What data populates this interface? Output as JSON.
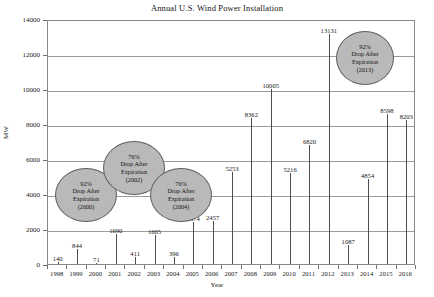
{
  "chart_data": {
    "type": "bar",
    "title": "Annual U.S. Wind Power Installation",
    "xlabel": "Year",
    "ylabel": "MW",
    "categories": [
      "1998",
      "1999",
      "2000",
      "2001",
      "2002",
      "2003",
      "2004",
      "2005",
      "2006",
      "2007",
      "2008",
      "2009",
      "2010",
      "2011",
      "2012",
      "2013",
      "2014",
      "2015",
      "2016"
    ],
    "values": [
      140,
      844,
      71,
      1690,
      411,
      1665,
      396,
      2374,
      2457,
      5253,
      8362,
      10005,
      5216,
      6820,
      13131,
      1087,
      4854,
      8598,
      8203
    ],
    "ylim": [
      0,
      14000
    ],
    "y_ticks": [
      "0",
      "2000",
      "4000",
      "6000",
      "8000",
      "10000",
      "12000",
      "14000"
    ],
    "grid": true,
    "legend": "none",
    "annotations": [
      {
        "id": "expiration-2000",
        "percent": "92%",
        "line1": "Drop After",
        "line2": "Expiration",
        "year": "(2000)"
      },
      {
        "id": "expiration-2002",
        "percent": "76%",
        "line1": "Drop After",
        "line2": "Expiration",
        "year": "(2002)"
      },
      {
        "id": "expiration-2004",
        "percent": "76%",
        "line1": "Drop After",
        "line2": "Expiration",
        "year": "(2004)"
      },
      {
        "id": "expiration-2013",
        "percent": "92%",
        "line1": "Drop After",
        "line2": "Expiration",
        "year": "(2013)"
      }
    ],
    "colors": {
      "bar": "#4d4d4d",
      "grid": "#9a9a9a",
      "frame": "#8a8a8a",
      "bubble_fill": "#b9b9b9",
      "bubble_stroke": "#5e5e5e",
      "text": "#1a1a1a"
    }
  }
}
